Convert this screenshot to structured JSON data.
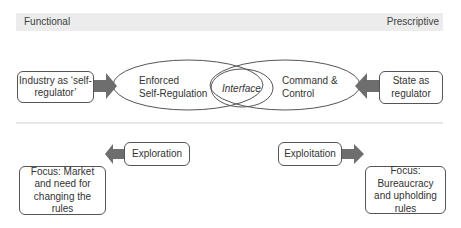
{
  "axis": {
    "left_label": "Functional",
    "right_label": "Prescriptive"
  },
  "top_row": {
    "left_actor": "Industry as ‘self-regulator’",
    "left_ellipse": [
      "Enforced",
      "Self-Regulation"
    ],
    "interface": "Interface",
    "right_ellipse": [
      "Command &",
      "Control"
    ],
    "right_actor": "State as regulator"
  },
  "bottom_row": {
    "left_mode": "Exploration",
    "left_focus": "Focus: Market and need for changing the rules",
    "right_mode": "Exploitation",
    "right_focus": "Focus: Bureaucracy and upholding rules"
  },
  "colors": {
    "arrow": "#6e6e6e",
    "band": "#ececec",
    "outline": "#555555",
    "divider": "#cfcfcf"
  }
}
